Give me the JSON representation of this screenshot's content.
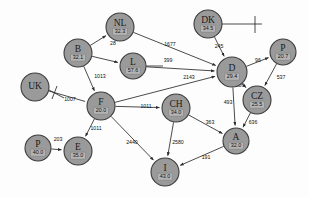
{
  "diagram": {
    "type": "node-link",
    "node_fill": "#9a9a9a",
    "node_stroke": "#3c3c3c",
    "edge_color": "#2a2a2a",
    "background": "#fdfdfd",
    "nodes": [
      {
        "id": "UK",
        "code": "UK",
        "value": "",
        "x": 35,
        "y": 87,
        "r": 14
      },
      {
        "id": "NL",
        "code": "NL",
        "value": "32.3",
        "x": 120,
        "y": 27,
        "r": 14
      },
      {
        "id": "B",
        "code": "B",
        "value": "32.1",
        "x": 78,
        "y": 53,
        "r": 14
      },
      {
        "id": "L",
        "code": "L",
        "value": "57.6",
        "x": 133,
        "y": 66,
        "r": 13
      },
      {
        "id": "DK",
        "code": "DK",
        "value": "34.5",
        "x": 208,
        "y": 24,
        "r": 14
      },
      {
        "id": "D",
        "code": "D",
        "value": "29.4",
        "x": 232,
        "y": 72,
        "r": 15
      },
      {
        "id": "P2",
        "code": "P",
        "value": "20.7",
        "x": 283,
        "y": 52,
        "r": 13
      },
      {
        "id": "CZ",
        "code": "CZ",
        "value": "25.5",
        "x": 257,
        "y": 100,
        "r": 14
      },
      {
        "id": "F",
        "code": "F",
        "value": "20.0",
        "x": 101,
        "y": 106,
        "r": 14
      },
      {
        "id": "CH",
        "code": "CH",
        "value": "34.0",
        "x": 176,
        "y": 108,
        "r": 14
      },
      {
        "id": "A",
        "code": "A",
        "value": "32.0",
        "x": 236,
        "y": 141,
        "r": 13
      },
      {
        "id": "P1",
        "code": "P",
        "value": "40.0",
        "x": 38,
        "y": 148,
        "r": 13
      },
      {
        "id": "E",
        "code": "E",
        "value": "35.0",
        "x": 78,
        "y": 151,
        "r": 14
      },
      {
        "id": "I",
        "code": "I",
        "value": "43.0",
        "x": 165,
        "y": 172,
        "r": 14
      }
    ],
    "edges": [
      {
        "from": "B",
        "to": "NL",
        "label": "",
        "lx": 0,
        "ly": 0,
        "arrow": "to"
      },
      {
        "from": "NL",
        "to": "D",
        "label": "1677",
        "lx": 170,
        "ly": 45,
        "arrow": "to"
      },
      {
        "from": "B",
        "to": "L",
        "label": "28",
        "lx": 113,
        "ly": 44,
        "arrow": "to"
      },
      {
        "from": "L",
        "to": "D",
        "label": "399",
        "lx": 168,
        "ly": 61,
        "arrow": "to"
      },
      {
        "from": "DK",
        "to": "D",
        "label": "245",
        "lx": 219,
        "ly": 47,
        "arrow": "to"
      },
      {
        "from": "D",
        "to": "P2",
        "label": "96",
        "lx": 258,
        "ly": 61,
        "arrow": "to"
      },
      {
        "from": "D",
        "to": "CZ",
        "label": "906",
        "lx": 240,
        "ly": 86,
        "arrow": "to"
      },
      {
        "from": "P2",
        "to": "CZ",
        "label": "537",
        "lx": 281,
        "ly": 78,
        "arrow": "to"
      },
      {
        "from": "F",
        "to": "D",
        "label": "2143",
        "lx": 189,
        "ly": 78,
        "arrow": "to"
      },
      {
        "from": "B",
        "to": "F",
        "label": "1013",
        "lx": 100,
        "ly": 77,
        "arrow": "to"
      },
      {
        "from": "UK",
        "to": "F",
        "label": "1007",
        "lx": 70,
        "ly": 100,
        "arrow": "from"
      },
      {
        "from": "F",
        "to": "E",
        "label": "1011",
        "lx": 96,
        "ly": 129,
        "arrow": "to"
      },
      {
        "from": "F",
        "to": "CH",
        "label": "1011",
        "lx": 146,
        "ly": 107,
        "arrow": "to"
      },
      {
        "from": "D",
        "to": "A",
        "label": "493",
        "lx": 228,
        "ly": 103,
        "arrow": "to"
      },
      {
        "from": "CZ",
        "to": "A",
        "label": "636",
        "lx": 253,
        "ly": 123,
        "arrow": "to"
      },
      {
        "from": "CH",
        "to": "A",
        "label": "363",
        "lx": 210,
        "ly": 123,
        "arrow": "to"
      },
      {
        "from": "F",
        "to": "I",
        "label": "2440",
        "lx": 132,
        "ly": 143,
        "arrow": "to"
      },
      {
        "from": "CH",
        "to": "I",
        "label": "2580",
        "lx": 178,
        "ly": 143,
        "arrow": "to"
      },
      {
        "from": "A",
        "to": "I",
        "label": "191",
        "lx": 206,
        "ly": 158,
        "arrow": "to"
      },
      {
        "from": "P1",
        "to": "E",
        "label": "203",
        "lx": 58,
        "ly": 140,
        "arrow": "to"
      }
    ],
    "ticks": [
      {
        "id": "tick-dk",
        "x1": 222,
        "y1": 24,
        "x2": 262,
        "y2": 24
      },
      {
        "id": "tick-dk2",
        "x1": 255,
        "y1": 16,
        "x2": 255,
        "y2": 33
      },
      {
        "id": "tick-uk",
        "x1": 49,
        "y1": 90,
        "x2": 64,
        "y2": 98
      },
      {
        "id": "tick-uk2",
        "x1": 57,
        "y1": 86,
        "x2": 52,
        "y2": 99
      },
      {
        "id": "tick-l",
        "x1": 146,
        "y1": 66,
        "x2": 163,
        "y2": 66
      }
    ]
  }
}
